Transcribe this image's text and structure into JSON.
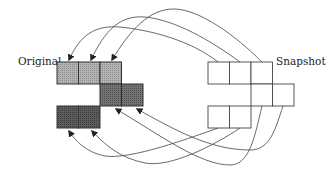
{
  "labels": {
    "original": "Original",
    "snapshot": "Snapshot"
  },
  "colors": {
    "original_row1": "#a9a9a9",
    "original_row2": "#6a6a6a",
    "original_row3": "#555555",
    "snapshot_fill": "#ffffff",
    "stroke": "#333333"
  },
  "grids": {
    "original": {
      "rows": [
        {
          "cells": 3,
          "x": 57,
          "y": 62,
          "shade": "light"
        },
        {
          "cells": 2,
          "x": 100,
          "y": 84,
          "shade": "dark"
        },
        {
          "cells": 2,
          "x": 57,
          "y": 106,
          "shade": "darker"
        }
      ],
      "cell_size": 21.5
    },
    "snapshot": {
      "rows": [
        {
          "cells": 3,
          "x": 208,
          "y": 62
        },
        {
          "cells": 2,
          "x": 251,
          "y": 84
        },
        {
          "cells": 2,
          "x": 208,
          "y": 106
        }
      ],
      "cell_size": 21.5
    }
  },
  "arrows": {
    "count": 7,
    "direction": "snapshot-to-original"
  }
}
